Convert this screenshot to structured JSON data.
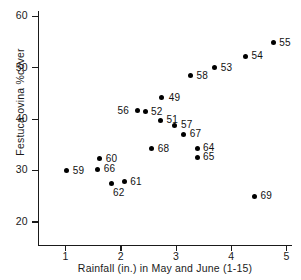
{
  "chart_data": {
    "type": "scatter",
    "title": "",
    "xlabel": "Rainfall (in.) in May and June (1-15)",
    "ylabel": "Festuca ovina %cover",
    "xlim": [
      0.5,
      5.1
    ],
    "ylim": [
      15.5,
      61
    ],
    "xticks": [
      1,
      2,
      3,
      4,
      5
    ],
    "xticklabels": [
      "1",
      "2",
      "3",
      "4",
      "5"
    ],
    "yticks": [
      20,
      30,
      40,
      50,
      60
    ],
    "yticklabels": [
      "20",
      "30",
      "40",
      "50",
      "60"
    ],
    "grid": false,
    "legend": null,
    "point_label_key": "year",
    "points": [
      {
        "label": "59",
        "x": 1.02,
        "y": 29.9,
        "lx": 6,
        "ly": -6
      },
      {
        "label": "60",
        "x": 1.62,
        "y": 32.3,
        "lx": 6,
        "ly": -6
      },
      {
        "label": "66",
        "x": 1.58,
        "y": 30.2,
        "lx": 6,
        "ly": -6
      },
      {
        "label": "62",
        "x": 1.84,
        "y": 27.4,
        "lx": 1,
        "ly": 3
      },
      {
        "label": "61",
        "x": 2.06,
        "y": 27.8,
        "lx": 6,
        "ly": -6
      },
      {
        "label": "56",
        "x": 2.3,
        "y": 41.6,
        "lx": -20,
        "ly": -6
      },
      {
        "label": "52",
        "x": 2.44,
        "y": 41.4,
        "lx": 6,
        "ly": -6
      },
      {
        "label": "68",
        "x": 2.56,
        "y": 34.2,
        "lx": 6,
        "ly": -6
      },
      {
        "label": "51",
        "x": 2.72,
        "y": 39.8,
        "lx": 6,
        "ly": -6
      },
      {
        "label": "49",
        "x": 2.74,
        "y": 44.1,
        "lx": 7,
        "ly": -6
      },
      {
        "label": "57",
        "x": 2.98,
        "y": 38.8,
        "lx": 6,
        "ly": -6
      },
      {
        "label": "67",
        "x": 3.14,
        "y": 37.0,
        "lx": 6,
        "ly": -6
      },
      {
        "label": "58",
        "x": 3.26,
        "y": 48.4,
        "lx": 6,
        "ly": -6
      },
      {
        "label": "64",
        "x": 3.38,
        "y": 34.3,
        "lx": 6,
        "ly": -6
      },
      {
        "label": "65",
        "x": 3.38,
        "y": 32.6,
        "lx": 6,
        "ly": -6
      },
      {
        "label": "53",
        "x": 3.7,
        "y": 50.0,
        "lx": 6,
        "ly": -6
      },
      {
        "label": "54",
        "x": 4.26,
        "y": 52.2,
        "lx": 6,
        "ly": -6
      },
      {
        "label": "69",
        "x": 4.42,
        "y": 25.0,
        "lx": 6,
        "ly": -6
      },
      {
        "label": "55",
        "x": 4.76,
        "y": 54.8,
        "lx": 6,
        "ly": -6
      }
    ]
  }
}
